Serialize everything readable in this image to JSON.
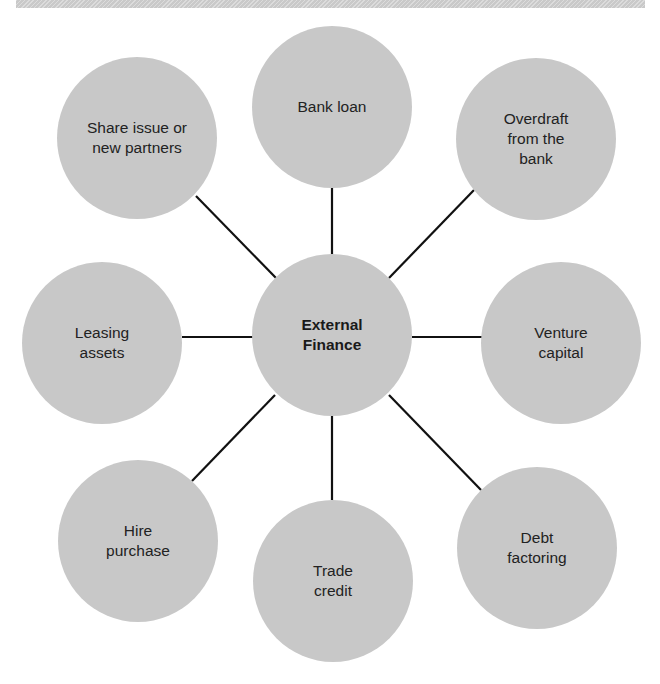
{
  "diagram": {
    "type": "hub-and-spoke",
    "colors": {
      "node_fill": "#c8c8c8",
      "connector": "#111111",
      "text": "#222222",
      "header_bar": "#c9c9c9"
    },
    "hub": {
      "label": "External\nFinance"
    },
    "spokes": [
      {
        "id": "bank-loan",
        "label": "Bank loan"
      },
      {
        "id": "overdraft",
        "label": "Overdraft\nfrom the\nbank"
      },
      {
        "id": "venture-capital",
        "label": "Venture\ncapital"
      },
      {
        "id": "debt-factoring",
        "label": "Debt\nfactoring"
      },
      {
        "id": "trade-credit",
        "label": "Trade\ncredit"
      },
      {
        "id": "hire-purchase",
        "label": "Hire\npurchase"
      },
      {
        "id": "leasing-assets",
        "label": "Leasing\nassets"
      },
      {
        "id": "share-issue",
        "label": "Share issue or\nnew partners"
      }
    ]
  }
}
